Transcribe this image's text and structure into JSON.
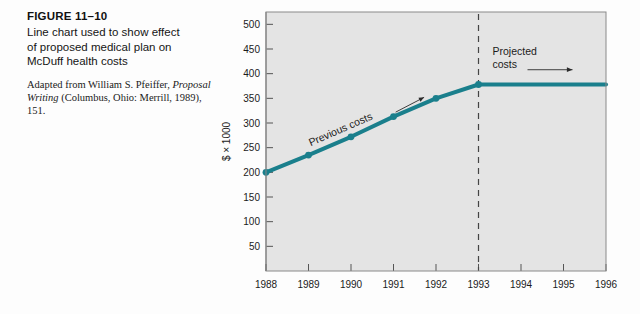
{
  "caption": {
    "figure_number": "FIGURE 11–10",
    "title_lines": [
      "Line chart used to show effect",
      "of proposed medical plan on",
      "McDuff health costs"
    ],
    "source_prefix": "Adapted from William S. Pfeiffer, ",
    "source_italic": "Proposal Writing",
    "source_suffix": " (Columbus, Ohio: Merrill, 1989), 151."
  },
  "colors": {
    "line": "#1a7f8c",
    "plot_background": "#e4e4e4",
    "plot_border": "#8a8a8a",
    "text": "#1b1b1b",
    "divider": "#444444"
  },
  "chart_data": {
    "type": "line",
    "title": "",
    "xlabel": "",
    "ylabel": "$ × 1000",
    "xlim": [
      1988,
      1996
    ],
    "ylim": [
      0,
      525
    ],
    "ytick_labels": [
      "50",
      "100",
      "150",
      "200",
      "250",
      "300",
      "350",
      "400",
      "450",
      "500"
    ],
    "ytick_values": [
      50,
      100,
      150,
      200,
      250,
      300,
      350,
      400,
      450,
      500
    ],
    "xtick_labels": [
      "1988",
      "1989",
      "1990",
      "1991",
      "1992",
      "1993",
      "1994",
      "1995",
      "1996"
    ],
    "xtick_values": [
      1988,
      1989,
      1990,
      1991,
      1992,
      1993,
      1994,
      1995,
      1996
    ],
    "grid": false,
    "legend": "none",
    "series": [
      {
        "name": "Previous costs",
        "x": [
          1988,
          1989,
          1990,
          1991,
          1992,
          1993
        ],
        "values": [
          200,
          235,
          272,
          313,
          350,
          378
        ],
        "markers": true
      },
      {
        "name": "Projected costs",
        "x": [
          1993,
          1996
        ],
        "values": [
          378,
          378
        ],
        "markers": false
      }
    ],
    "annotations": [
      {
        "text": "Previous costs",
        "kind": "rotated-label-with-arrow"
      },
      {
        "text_line1": "Projected",
        "text_line2": "costs",
        "kind": "label-with-arrow"
      }
    ],
    "divider": {
      "at_x": 1993,
      "style": "dashed"
    }
  }
}
